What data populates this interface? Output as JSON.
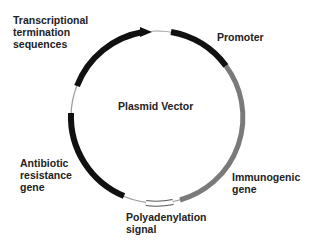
{
  "diagram": {
    "title": "Plasmid Vector",
    "labels": {
      "termination": "Transcriptional\ntermination\nsequences",
      "promoter": "Promoter",
      "immunogenic": "Immunogenic\ngene",
      "polyadenylation": "Polyadenylation\nsignal",
      "antibiotic": "Antibiotic\nresistance\ngene"
    },
    "colors": {
      "black_segment": "#111111",
      "gray_segment": "#7a7a7a",
      "thin_line": "#999999",
      "box_fill": "#ffffff",
      "text": "#222222"
    }
  }
}
